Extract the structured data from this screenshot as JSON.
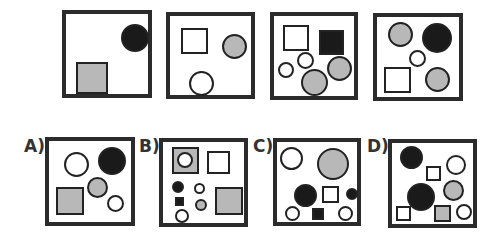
{
  "colors": {
    "black": "#1a1a1a",
    "gray": "#b8b8b8",
    "white": "#ffffff",
    "border": "#2b2b2b"
  },
  "question_row": [
    {
      "name": "figure-1",
      "box": [
        62,
        10,
        90,
        88
      ],
      "shapes": [
        {
          "type": "circle",
          "fill": "black",
          "x": 55,
          "y": 10,
          "w": 28,
          "h": 28
        },
        {
          "type": "square",
          "fill": "gray",
          "x": 10,
          "y": 48,
          "w": 32,
          "h": 32
        }
      ]
    },
    {
      "name": "figure-2",
      "box": [
        166,
        12,
        89,
        87
      ],
      "shapes": [
        {
          "type": "square",
          "fill": "white",
          "x": 11,
          "y": 12,
          "w": 27,
          "h": 26
        },
        {
          "type": "circle",
          "fill": "gray",
          "x": 52,
          "y": 18,
          "w": 25,
          "h": 25
        },
        {
          "type": "circle",
          "fill": "white",
          "x": 19,
          "y": 55,
          "w": 25,
          "h": 25
        }
      ]
    },
    {
      "name": "figure-3",
      "box": [
        270,
        12,
        88,
        88
      ],
      "shapes": [
        {
          "type": "square",
          "fill": "white",
          "x": 9,
          "y": 9,
          "w": 26,
          "h": 26
        },
        {
          "type": "square",
          "fill": "black",
          "x": 45,
          "y": 14,
          "w": 25,
          "h": 25
        },
        {
          "type": "circle",
          "fill": "white",
          "x": 23,
          "y": 36,
          "w": 17,
          "h": 17
        },
        {
          "type": "circle",
          "fill": "white",
          "x": 4,
          "y": 46,
          "w": 16,
          "h": 16
        },
        {
          "type": "circle",
          "fill": "gray",
          "x": 27,
          "y": 53,
          "w": 27,
          "h": 27
        },
        {
          "type": "circle",
          "fill": "gray",
          "x": 53,
          "y": 40,
          "w": 25,
          "h": 25
        }
      ]
    },
    {
      "name": "figure-4",
      "box": [
        373,
        13,
        90,
        88
      ],
      "shapes": [
        {
          "type": "circle",
          "fill": "gray",
          "x": 11,
          "y": 5,
          "w": 25,
          "h": 25
        },
        {
          "type": "circle",
          "fill": "black",
          "x": 45,
          "y": 6,
          "w": 30,
          "h": 30
        },
        {
          "type": "circle",
          "fill": "white",
          "x": 32,
          "y": 33,
          "w": 17,
          "h": 17
        },
        {
          "type": "square",
          "fill": "white",
          "x": 7,
          "y": 50,
          "w": 27,
          "h": 26
        },
        {
          "type": "circle",
          "fill": "gray",
          "x": 48,
          "y": 50,
          "w": 25,
          "h": 25
        }
      ]
    }
  ],
  "answer_row": [
    {
      "name": "option-a",
      "label": "A)",
      "label_pos": [
        24,
        136
      ],
      "box": [
        45,
        137,
        90,
        89
      ],
      "shapes": [
        {
          "type": "circle",
          "fill": "white",
          "x": 15,
          "y": 11,
          "w": 25,
          "h": 25
        },
        {
          "type": "circle",
          "fill": "black",
          "x": 49,
          "y": 6,
          "w": 28,
          "h": 28
        },
        {
          "type": "circle",
          "fill": "gray",
          "x": 38,
          "y": 36,
          "w": 21,
          "h": 21
        },
        {
          "type": "square",
          "fill": "white",
          "x": 0,
          "y": 0,
          "w": 0,
          "h": 0
        },
        {
          "type": "square",
          "fill": "gray",
          "x": 7,
          "y": 46,
          "w": 28,
          "h": 28
        },
        {
          "type": "circle",
          "fill": "white",
          "x": 58,
          "y": 54,
          "w": 17,
          "h": 17
        }
      ]
    },
    {
      "name": "option-b",
      "label": "B)",
      "label_pos": [
        139,
        136
      ],
      "box": [
        159,
        138,
        89,
        89
      ],
      "shapes": [
        {
          "type": "square",
          "fill": "gray",
          "x": 9,
          "y": 5,
          "w": 27,
          "h": 27
        },
        {
          "type": "circle",
          "fill": "white",
          "x": 14,
          "y": 10,
          "w": 16,
          "h": 16
        },
        {
          "type": "square",
          "fill": "white",
          "x": 44,
          "y": 9,
          "w": 23,
          "h": 23
        },
        {
          "type": "circle",
          "fill": "black",
          "x": 9,
          "y": 39,
          "w": 12,
          "h": 12
        },
        {
          "type": "circle",
          "fill": "white",
          "x": 31,
          "y": 41,
          "w": 11,
          "h": 11
        },
        {
          "type": "square",
          "fill": "black",
          "x": 12,
          "y": 55,
          "w": 9,
          "h": 9
        },
        {
          "type": "circle",
          "fill": "gray",
          "x": 32,
          "y": 57,
          "w": 12,
          "h": 12
        },
        {
          "type": "circle",
          "fill": "white",
          "x": 12,
          "y": 67,
          "w": 14,
          "h": 14
        },
        {
          "type": "square",
          "fill": "gray",
          "x": 52,
          "y": 45,
          "w": 28,
          "h": 28
        }
      ]
    },
    {
      "name": "option-c",
      "label": "C)",
      "label_pos": [
        253,
        136
      ],
      "box": [
        273,
        138,
        88,
        88
      ],
      "shapes": [
        {
          "type": "circle",
          "fill": "white",
          "x": 3,
          "y": 5,
          "w": 23,
          "h": 23
        },
        {
          "type": "circle",
          "fill": "gray",
          "x": 40,
          "y": 6,
          "w": 32,
          "h": 32
        },
        {
          "type": "circle",
          "fill": "black",
          "x": 17,
          "y": 42,
          "w": 23,
          "h": 23
        },
        {
          "type": "square",
          "fill": "white",
          "x": 45,
          "y": 44,
          "w": 17,
          "h": 17
        },
        {
          "type": "circle",
          "fill": "black",
          "x": 69,
          "y": 46,
          "w": 12,
          "h": 12
        },
        {
          "type": "circle",
          "fill": "white",
          "x": 8,
          "y": 64,
          "w": 15,
          "h": 15
        },
        {
          "type": "square",
          "fill": "black",
          "x": 35,
          "y": 66,
          "w": 12,
          "h": 12
        },
        {
          "type": "circle",
          "fill": "white",
          "x": 61,
          "y": 64,
          "w": 15,
          "h": 15
        }
      ]
    },
    {
      "name": "option-d",
      "label": "D)",
      "label_pos": [
        367,
        136
      ],
      "box": [
        388,
        139,
        89,
        89
      ],
      "shapes": [
        {
          "type": "circle",
          "fill": "black",
          "x": 8,
          "y": 3,
          "w": 23,
          "h": 23
        },
        {
          "type": "circle",
          "fill": "white",
          "x": 54,
          "y": 12,
          "w": 20,
          "h": 20
        },
        {
          "type": "square",
          "fill": "white",
          "x": 34,
          "y": 23,
          "w": 15,
          "h": 15
        },
        {
          "type": "circle",
          "fill": "gray",
          "x": 51,
          "y": 37,
          "w": 21,
          "h": 21
        },
        {
          "type": "circle",
          "fill": "black",
          "x": 15,
          "y": 40,
          "w": 28,
          "h": 28
        },
        {
          "type": "square",
          "fill": "white",
          "x": 4,
          "y": 63,
          "w": 15,
          "h": 15
        },
        {
          "type": "square",
          "fill": "gray",
          "x": 42,
          "y": 62,
          "w": 17,
          "h": 17
        },
        {
          "type": "circle",
          "fill": "white",
          "x": 64,
          "y": 61,
          "w": 16,
          "h": 16
        }
      ]
    }
  ]
}
